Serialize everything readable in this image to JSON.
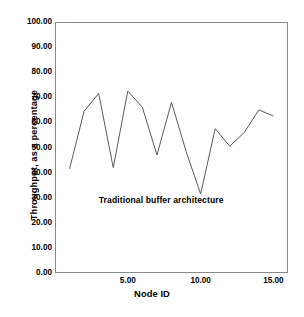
{
  "figure": {
    "top_fragment_text": "",
    "background_color": "#ffffff",
    "frame_color": "#8a8a8a",
    "line_color": "#5a5a5a"
  },
  "chart_data": {
    "type": "line",
    "title": "",
    "xlabel": "Node ID",
    "ylabel": "Throughput, as a percentage",
    "xlim": [
      0,
      16
    ],
    "ylim": [
      0,
      100
    ],
    "grid": false,
    "legend": null,
    "x_ticks": [
      5,
      10,
      15
    ],
    "x_tick_labels": [
      "5.00",
      "10.00",
      "15.00"
    ],
    "y_ticks": [
      0,
      10,
      20,
      30,
      40,
      50,
      60,
      70,
      80,
      90,
      100
    ],
    "y_tick_labels": [
      "0.00",
      "10.00",
      "20.00",
      "30.00",
      "40.00",
      "50.00",
      "60.00",
      "70.00",
      "80.00",
      "90.00",
      "100.00"
    ],
    "x": [
      1,
      2,
      3,
      4,
      5,
      6,
      7,
      8,
      9,
      10,
      11,
      12,
      13,
      14,
      15
    ],
    "series": [
      {
        "name": "Traditional buffer architecture",
        "values": [
          41.5,
          64.5,
          71.5,
          42.0,
          72.5,
          66.0,
          47.0,
          68.0,
          48.5,
          31.5,
          57.5,
          50.5,
          56.0,
          65.0,
          62.5
        ]
      }
    ],
    "annotations": [
      {
        "text": "Traditional buffer architecture",
        "x": 3.0,
        "y": 28.5
      }
    ]
  }
}
